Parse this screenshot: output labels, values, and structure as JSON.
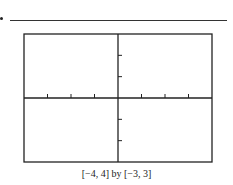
{
  "answer_line": {
    "present": true
  },
  "chart_data": {
    "type": "line",
    "title": "",
    "series": [],
    "xlabel": "",
    "ylabel": "",
    "xlim": [
      -4,
      4
    ],
    "ylim": [
      -3,
      3
    ],
    "x_ticks": [
      -3,
      -2,
      -1,
      1,
      2,
      3
    ],
    "y_ticks": [
      -2,
      -1,
      1,
      2
    ],
    "grid": false,
    "caption": "[−4, 4] by [−3, 3]",
    "note": "Blank graphing-calculator viewing window with axes and tick marks only"
  },
  "caption": "[−4, 4] by [−3, 3]"
}
